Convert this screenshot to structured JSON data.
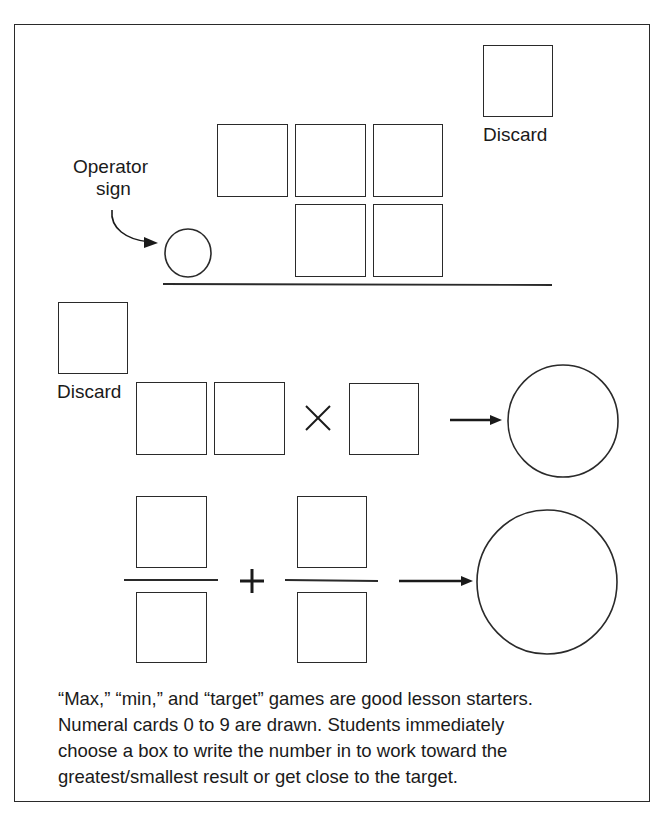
{
  "diagram": {
    "top_section": {
      "discard_label": "Discard",
      "operator_label_line1": "Operator",
      "operator_label_line2": "sign",
      "digit_boxes_row1": 3,
      "digit_boxes_row2": 2,
      "operator_circle": "empty"
    },
    "middle_section": {
      "discard_label": "Discard",
      "operator_symbol": "×",
      "left_digit_boxes": 2,
      "right_digit_boxes": 1,
      "result_shape": "circle",
      "arrow": "right-arrow"
    },
    "bottom_section": {
      "operator_symbol": "+",
      "fractions": 2,
      "result_shape": "circle",
      "arrow": "right-arrow"
    },
    "caption": {
      "lines": [
        "“Max,” “min,” and “target” games are good lesson starters.",
        "Numeral cards 0 to 9 are drawn. Students immediately",
        "choose a box to write the number in to work toward the",
        "greatest/smallest result or get close to the target."
      ]
    },
    "colors": {
      "stroke": "#2a2a2a",
      "text": "#1a1a1a",
      "background": "#ffffff"
    }
  }
}
